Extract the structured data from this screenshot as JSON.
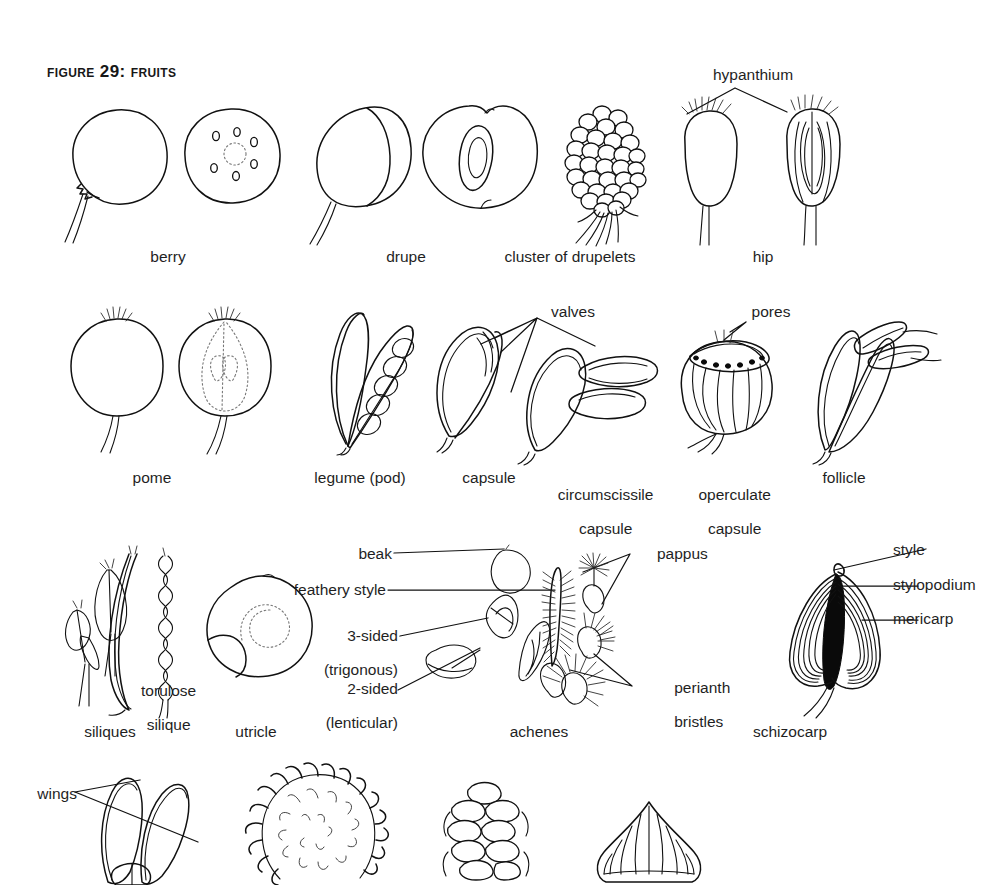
{
  "figure": {
    "title": "Figure 29: Fruits",
    "page_background": "#ffffff",
    "ink_color": "#111111"
  },
  "rows": [
    {
      "id": "row-1",
      "labels": [
        {
          "name": "berry",
          "text": "berry"
        },
        {
          "name": "drupe",
          "text": "drupe"
        },
        {
          "name": "cluster-of-drupelets",
          "text": "cluster of drupelets"
        },
        {
          "name": "hip",
          "text": "hip"
        }
      ],
      "annotations": [
        {
          "name": "hypanthium",
          "text": "hypanthium"
        }
      ]
    },
    {
      "id": "row-2",
      "labels": [
        {
          "name": "pome",
          "text": "pome"
        },
        {
          "name": "legume-pod",
          "text": "legume (pod)"
        },
        {
          "name": "capsule",
          "text": "capsule"
        },
        {
          "name": "circumscissile-capsule",
          "text": "circumscissile",
          "text2": "capsule"
        },
        {
          "name": "operculate-capsule",
          "text": "operculate",
          "text2": "capsule"
        },
        {
          "name": "follicle",
          "text": "follicle"
        }
      ],
      "annotations": [
        {
          "name": "valves",
          "text": "valves"
        },
        {
          "name": "pores",
          "text": "pores"
        }
      ]
    },
    {
      "id": "row-3",
      "labels": [
        {
          "name": "siliques",
          "text": "siliques"
        },
        {
          "name": "utricle",
          "text": "utricle"
        },
        {
          "name": "achenes",
          "text": "achenes"
        },
        {
          "name": "schizocarp",
          "text": "schizocarp"
        }
      ],
      "annotations": [
        {
          "name": "torulose-silique",
          "text": "torulose",
          "text2": "silique"
        },
        {
          "name": "beak",
          "text": "beak"
        },
        {
          "name": "feathery-style",
          "text": "feathery style"
        },
        {
          "name": "three-sided-trigonous",
          "text": "3-sided",
          "text2": "(trigonous)"
        },
        {
          "name": "two-sided-lenticular",
          "text": "2-sided",
          "text2": "(lenticular)"
        },
        {
          "name": "pappus",
          "text": "pappus"
        },
        {
          "name": "perianth-bristles",
          "text": "perianth",
          "text2": "bristles"
        },
        {
          "name": "style",
          "text": "style"
        },
        {
          "name": "stylopodium",
          "text": "stylopodium"
        },
        {
          "name": "mericarp",
          "text": "mericarp"
        }
      ]
    },
    {
      "id": "row-4",
      "labels": [],
      "annotations": [
        {
          "name": "wings",
          "text": "wings"
        }
      ]
    }
  ]
}
